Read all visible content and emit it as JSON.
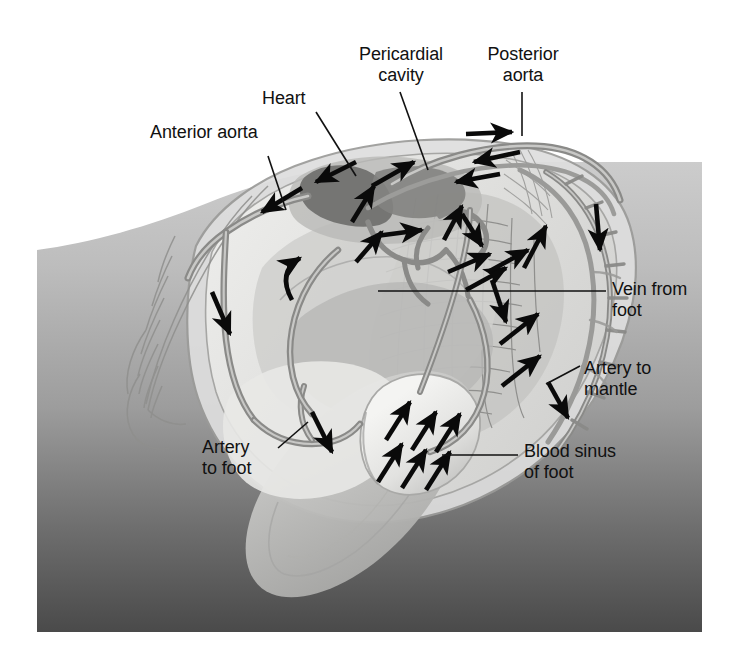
{
  "figure": {
    "type": "anatomical-diagram",
    "canvas": {
      "width": 732,
      "height": 660
    },
    "panel": {
      "x": 37,
      "y": 162,
      "width": 665,
      "height": 470,
      "gradient_top": "#c9c9c9",
      "gradient_bottom": "#4f4f4f"
    }
  },
  "palette": {
    "background_white": "#ffffff",
    "panel_light": "#c6c6c6",
    "panel_dark": "#4e4e4e",
    "shell_pale": "#f2f2f0",
    "mantle_light": "#dcdcda",
    "mantle_mid": "#c2c2c0",
    "tissue_mid": "#b4b4b2",
    "tissue_dark": "#9a9a98",
    "vessel_gray": "#8d8d8b",
    "vessel_dark": "#7a7a78",
    "heart_dark": "#6f6f6d",
    "arrow_black": "#0a0a0a",
    "leader_black": "#111111",
    "text_black": "#111111"
  },
  "labels": [
    {
      "id": "anterior-aorta",
      "text": "Anterior aorta",
      "x": 150,
      "y": 132,
      "align": "lft",
      "leader": [
        [
          270,
          156
        ],
        [
          285,
          205
        ]
      ]
    },
    {
      "id": "heart",
      "text": "Heart",
      "x": 262,
      "y": 88,
      "align": "lft",
      "leader": [
        [
          318,
          112
        ],
        [
          355,
          172
        ]
      ]
    },
    {
      "id": "pericardial-cavity",
      "text": "Pericardial\ncavity",
      "x": 331,
      "y": 44,
      "align": "ctr",
      "leader": [
        [
          400,
          90
        ],
        [
          430,
          166
        ]
      ]
    },
    {
      "id": "posterior-aorta",
      "text": "Posterior\naorta",
      "x": 474,
      "y": 44,
      "align": "ctr",
      "leader": [
        [
          522,
          90
        ],
        [
          522,
          134
        ]
      ]
    },
    {
      "id": "vein-from-foot",
      "text": "Vein from\nfoot",
      "x": 614,
      "y": 279,
      "align": "lft",
      "leader": [
        [
          376,
          291
        ],
        [
          604,
          291
        ]
      ]
    },
    {
      "id": "artery-to-mantle",
      "text": "Artery to\nmantle",
      "x": 586,
      "y": 360,
      "align": "lft",
      "leader": [
        [
          546,
          384
        ],
        [
          578,
          366
        ]
      ]
    },
    {
      "id": "blood-sinus-of-foot",
      "text": "Blood sinus\nof foot",
      "x": 524,
      "y": 444,
      "align": "lft",
      "leader": [
        [
          442,
          455
        ],
        [
          516,
          455
        ]
      ]
    },
    {
      "id": "artery-to-foot",
      "text": "Artery\nto foot",
      "x": 202,
      "y": 438,
      "align": "lft",
      "leader": [
        [
          275,
          450
        ],
        [
          305,
          424
        ]
      ]
    }
  ],
  "flow_arrows": [
    {
      "id": "arrow-anterior-aorta-out",
      "x": 268,
      "y": 207,
      "angle": 205,
      "len": 42
    },
    {
      "id": "arrow-heart-to-anterior",
      "x": 320,
      "y": 172,
      "angle": 198,
      "len": 40
    },
    {
      "id": "arrow-into-heart-up",
      "x": 372,
      "y": 190,
      "angle": 300,
      "len": 40
    },
    {
      "id": "arrow-pericardial-right",
      "x": 402,
      "y": 166,
      "angle": 332,
      "len": 42
    },
    {
      "id": "arrow-post-aorta-right",
      "x": 492,
      "y": 133,
      "angle": 0,
      "len": 44
    },
    {
      "id": "arrow-post-aorta-back1",
      "x": 498,
      "y": 160,
      "angle": 195,
      "len": 44
    },
    {
      "id": "arrow-post-aorta-back2",
      "x": 476,
      "y": 176,
      "angle": 190,
      "len": 44
    },
    {
      "id": "arrow-visceral-right",
      "x": 400,
      "y": 232,
      "angle": 350,
      "len": 42
    },
    {
      "id": "arrow-visceral-up",
      "x": 372,
      "y": 247,
      "angle": 300,
      "len": 36
    },
    {
      "id": "arrow-gill-up1",
      "x": 455,
      "y": 216,
      "angle": 310,
      "len": 36
    },
    {
      "id": "arrow-gill-down1",
      "x": 472,
      "y": 235,
      "angle": 60,
      "len": 34
    },
    {
      "id": "arrow-gill-ur1",
      "x": 468,
      "y": 258,
      "angle": 325,
      "len": 40
    },
    {
      "id": "arrow-gill-ur2",
      "x": 486,
      "y": 278,
      "angle": 325,
      "len": 40
    },
    {
      "id": "arrow-gill-ur3",
      "x": 508,
      "y": 258,
      "angle": 318,
      "len": 40
    },
    {
      "id": "arrow-mantle-down",
      "x": 598,
      "y": 225,
      "angle": 95,
      "len": 48
    },
    {
      "id": "arrow-mantle-up1",
      "x": 534,
      "y": 246,
      "angle": 290,
      "len": 44
    },
    {
      "id": "arrow-mantle-ur",
      "x": 518,
      "y": 328,
      "angle": 325,
      "len": 44
    },
    {
      "id": "arrow-mantle-ur2",
      "x": 536,
      "y": 320,
      "angle": 320,
      "len": 40
    },
    {
      "id": "arrow-mantle-lower-ur",
      "x": 520,
      "y": 370,
      "angle": 320,
      "len": 44
    },
    {
      "id": "arrow-mantle-down-low",
      "x": 560,
      "y": 400,
      "angle": 125,
      "len": 40
    },
    {
      "id": "arrow-visceral-down",
      "x": 498,
      "y": 300,
      "angle": 105,
      "len": 44
    },
    {
      "id": "arrow-anterior-down",
      "x": 222,
      "y": 312,
      "angle": 105,
      "len": 44
    },
    {
      "id": "arrow-foot-artery-down",
      "x": 322,
      "y": 432,
      "angle": 110,
      "len": 44
    },
    {
      "id": "arrow-sinus-1",
      "x": 398,
      "y": 420,
      "angle": 300,
      "len": 38
    },
    {
      "id": "arrow-sinus-2",
      "x": 424,
      "y": 430,
      "angle": 300,
      "len": 38
    },
    {
      "id": "arrow-sinus-3",
      "x": 448,
      "y": 432,
      "angle": 305,
      "len": 38
    },
    {
      "id": "arrow-sinus-4",
      "x": 390,
      "y": 462,
      "angle": 300,
      "len": 38
    },
    {
      "id": "arrow-sinus-5",
      "x": 414,
      "y": 468,
      "angle": 298,
      "len": 40
    },
    {
      "id": "arrow-sinus-6",
      "x": 438,
      "y": 470,
      "angle": 300,
      "len": 38
    },
    {
      "id": "arrow-curved-visceral",
      "x": 300,
      "y": 268,
      "angle": 318,
      "len": 40
    }
  ],
  "anatomy_parts": [
    {
      "id": "shell-valve",
      "name": "shell valve"
    },
    {
      "id": "mantle-edge",
      "name": "mantle edge"
    },
    {
      "id": "gill-ctenidium",
      "name": "gill (ctenidium)"
    },
    {
      "id": "visceral-mass",
      "name": "visceral mass"
    },
    {
      "id": "foot",
      "name": "foot"
    },
    {
      "id": "heart-ventricle",
      "name": "heart (ventricle)"
    },
    {
      "id": "pericardium",
      "name": "pericardial cavity"
    },
    {
      "id": "anterior-aorta",
      "name": "anterior aorta"
    },
    {
      "id": "posterior-aorta",
      "name": "posterior aorta"
    },
    {
      "id": "pedal-artery",
      "name": "artery to foot"
    },
    {
      "id": "mantle-artery",
      "name": "artery to mantle"
    },
    {
      "id": "pedal-vein",
      "name": "vein from foot"
    },
    {
      "id": "pedal-sinus",
      "name": "blood sinus of foot"
    }
  ]
}
